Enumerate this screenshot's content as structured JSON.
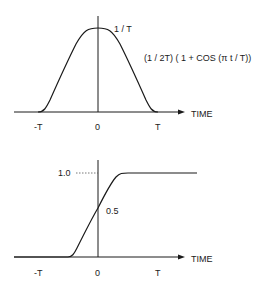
{
  "top_plot": {
    "title": "Raised cosine impulse response",
    "peak_label": "1 / T",
    "formula_label": "(1 / 2T) ( 1 + COS (π t / T))",
    "axis_label": "TIME",
    "ticks": [
      "-T",
      "0",
      "T"
    ]
  },
  "bottom_plot": {
    "title": "Step response",
    "level_high_label": "1.0",
    "level_mid_label": "0.5",
    "axis_label": "TIME",
    "ticks": [
      "-T",
      "0",
      "T"
    ]
  },
  "colors": {
    "ink": "#1a1a1a",
    "background": "#ffffff"
  }
}
